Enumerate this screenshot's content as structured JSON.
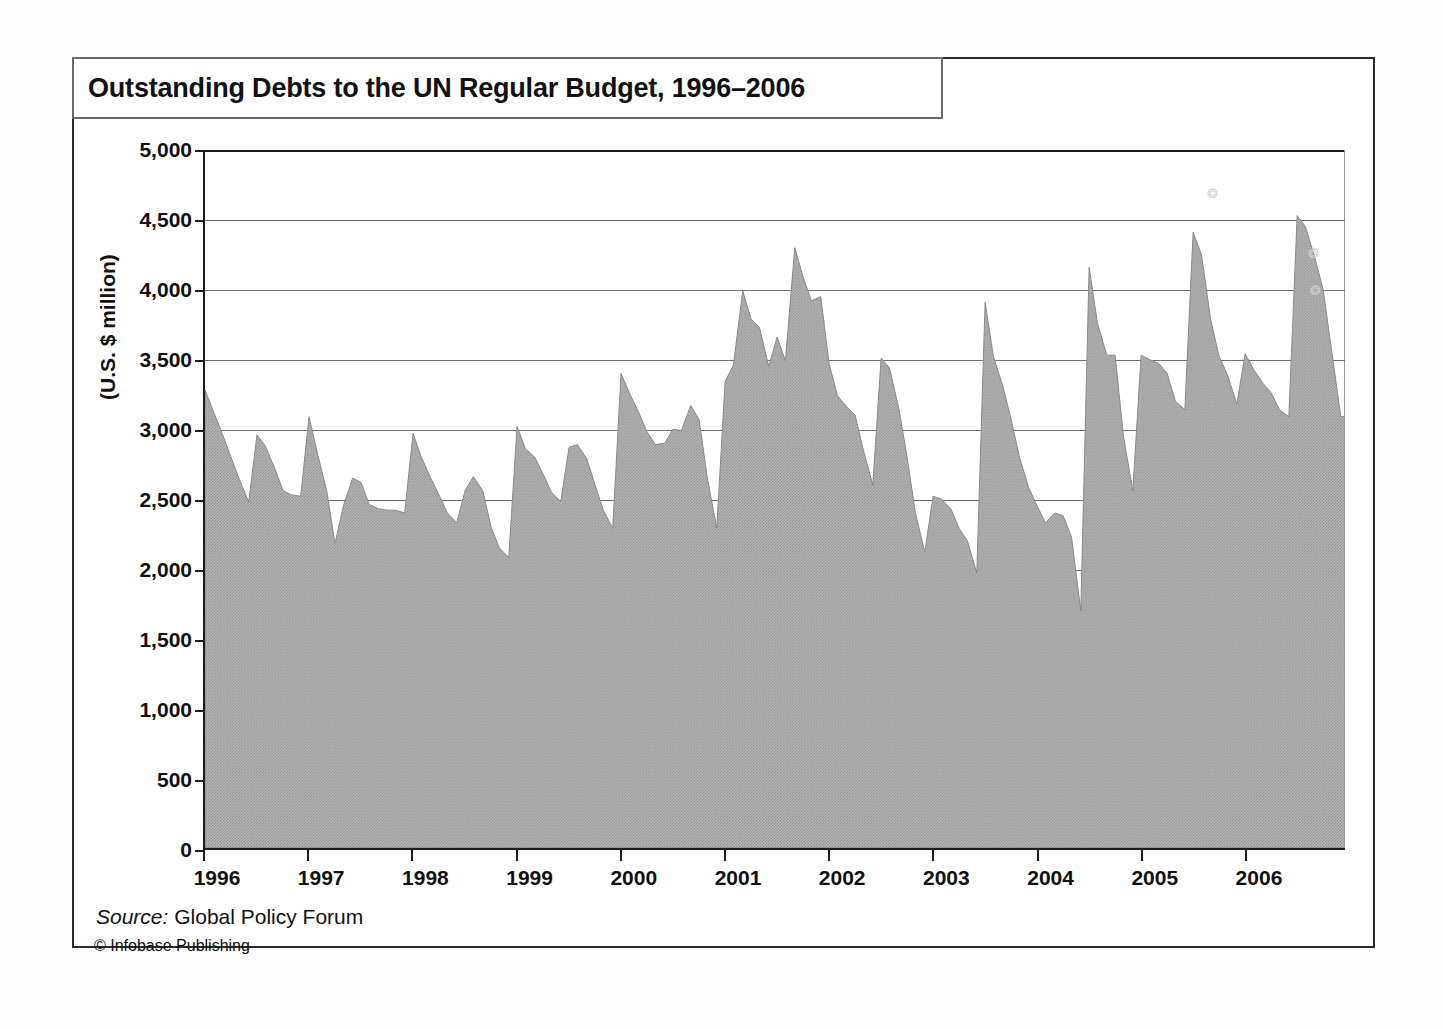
{
  "figure": {
    "title": "Outstanding Debts to the UN Regular Budget, 1996–2006",
    "source_label": "Source:",
    "source_value": " Global Policy Forum",
    "copyright": "© Infobase Publishing",
    "fill_color": "#a9a9a9",
    "axis_color": "#1c1c1c",
    "grid_color": "#6f6f6f"
  },
  "chart_data": {
    "type": "area",
    "title": "Outstanding Debts to the UN Regular Budget, 1996–2006",
    "xlabel": "",
    "ylabel": "(U.S. $ million)",
    "ylim": [
      0,
      5000
    ],
    "xlim": [
      1996.0,
      2006.96
    ],
    "grid": true,
    "legend": "none",
    "y_ticks": [
      0,
      500,
      1000,
      1500,
      2000,
      2500,
      3000,
      3500,
      4000,
      4500,
      5000
    ],
    "y_tick_labels": [
      "0",
      "500",
      "1,000",
      "1,500",
      "2,000",
      "2,500",
      "3,000",
      "3,500",
      "4,000",
      "4,500",
      "5,000"
    ],
    "x_ticks": [
      1996,
      1997,
      1998,
      1999,
      2000,
      2001,
      2002,
      2003,
      2004,
      2005,
      2006
    ],
    "x_tick_labels": [
      "1996",
      "1997",
      "1998",
      "1999",
      "2000",
      "2001",
      "2002",
      "2003",
      "2004",
      "2005",
      "2006"
    ],
    "series": [
      {
        "name": "Outstanding debts to the UN regular budget",
        "units": "U.S. $ million",
        "x": [
          1996.0,
          1996.08,
          1996.17,
          1996.25,
          1996.33,
          1996.42,
          1996.5,
          1996.58,
          1996.67,
          1996.75,
          1996.83,
          1996.92,
          1997.0,
          1997.08,
          1997.17,
          1997.25,
          1997.33,
          1997.42,
          1997.5,
          1997.58,
          1997.67,
          1997.75,
          1997.83,
          1997.92,
          1998.0,
          1998.08,
          1998.17,
          1998.25,
          1998.33,
          1998.42,
          1998.5,
          1998.58,
          1998.67,
          1998.75,
          1998.83,
          1998.92,
          1999.0,
          1999.08,
          1999.17,
          1999.25,
          1999.33,
          1999.42,
          1999.5,
          1999.58,
          1999.67,
          1999.75,
          1999.83,
          1999.92,
          2000.0,
          2000.08,
          2000.17,
          2000.25,
          2000.33,
          2000.42,
          2000.5,
          2000.58,
          2000.67,
          2000.75,
          2000.83,
          2000.92,
          2001.0,
          2001.08,
          2001.17,
          2001.25,
          2001.33,
          2001.42,
          2001.5,
          2001.58,
          2001.67,
          2001.75,
          2001.83,
          2001.92,
          2002.0,
          2002.08,
          2002.17,
          2002.25,
          2002.33,
          2002.42,
          2002.5,
          2002.58,
          2002.67,
          2002.75,
          2002.83,
          2002.92,
          2003.0,
          2003.08,
          2003.17,
          2003.25,
          2003.33,
          2003.42,
          2003.5,
          2003.58,
          2003.67,
          2003.75,
          2003.83,
          2003.92,
          2004.0,
          2004.08,
          2004.17,
          2004.25,
          2004.33,
          2004.42,
          2004.5,
          2004.58,
          2004.67,
          2004.75,
          2004.83,
          2004.92,
          2005.0,
          2005.08,
          2005.17,
          2005.25,
          2005.33,
          2005.42,
          2005.5,
          2005.58,
          2005.67,
          2005.75,
          2005.83,
          2005.92,
          2006.0,
          2006.08,
          2006.17,
          2006.25,
          2006.33,
          2006.42,
          2006.5,
          2006.58,
          2006.67,
          2006.75,
          2006.83,
          2006.92
        ],
        "values": [
          3280,
          3130,
          2960,
          2800,
          2640,
          2480,
          2960,
          2880,
          2720,
          2560,
          2530,
          2520,
          3090,
          2830,
          2560,
          2180,
          2450,
          2650,
          2620,
          2460,
          2430,
          2420,
          2420,
          2400,
          2970,
          2800,
          2650,
          2530,
          2400,
          2330,
          2560,
          2660,
          2560,
          2300,
          2150,
          2080,
          3020,
          2860,
          2800,
          2680,
          2550,
          2480,
          2870,
          2890,
          2790,
          2600,
          2420,
          2290,
          3400,
          3260,
          3120,
          2980,
          2890,
          2900,
          3000,
          2990,
          3170,
          3070,
          2650,
          2290,
          3340,
          3460,
          3990,
          3790,
          3730,
          3450,
          3660,
          3490,
          4300,
          4090,
          3920,
          3950,
          3470,
          3240,
          3160,
          3100,
          2850,
          2600,
          3510,
          3440,
          3150,
          2800,
          2400,
          2120,
          2520,
          2500,
          2430,
          2290,
          2200,
          1970,
          3910,
          3520,
          3310,
          3070,
          2800,
          2580,
          2450,
          2330,
          2400,
          2380,
          2230,
          1700,
          4160,
          3760,
          3530,
          3530,
          2950,
          2560,
          3530,
          3500,
          3470,
          3400,
          3200,
          3140,
          4410,
          4250,
          3780,
          3520,
          3390,
          3180,
          3540,
          3430,
          3330,
          3260,
          3140,
          3090,
          4530,
          4450,
          4230,
          4000,
          3570,
          3090
        ]
      }
    ],
    "peaks": [
      {
        "year": 2001.67,
        "value": 4300
      },
      {
        "year": 2004.5,
        "value": 4160
      },
      {
        "year": 2005.5,
        "value": 4410
      },
      {
        "year": 2006.5,
        "value": 4530
      }
    ],
    "troughs": [
      {
        "year": 2004.42,
        "value": 1700
      },
      {
        "year": 2003.42,
        "value": 1970
      },
      {
        "year": 1998.92,
        "value": 2080
      }
    ]
  },
  "speckles": [
    "⁂",
    "⁂",
    "⁂"
  ]
}
